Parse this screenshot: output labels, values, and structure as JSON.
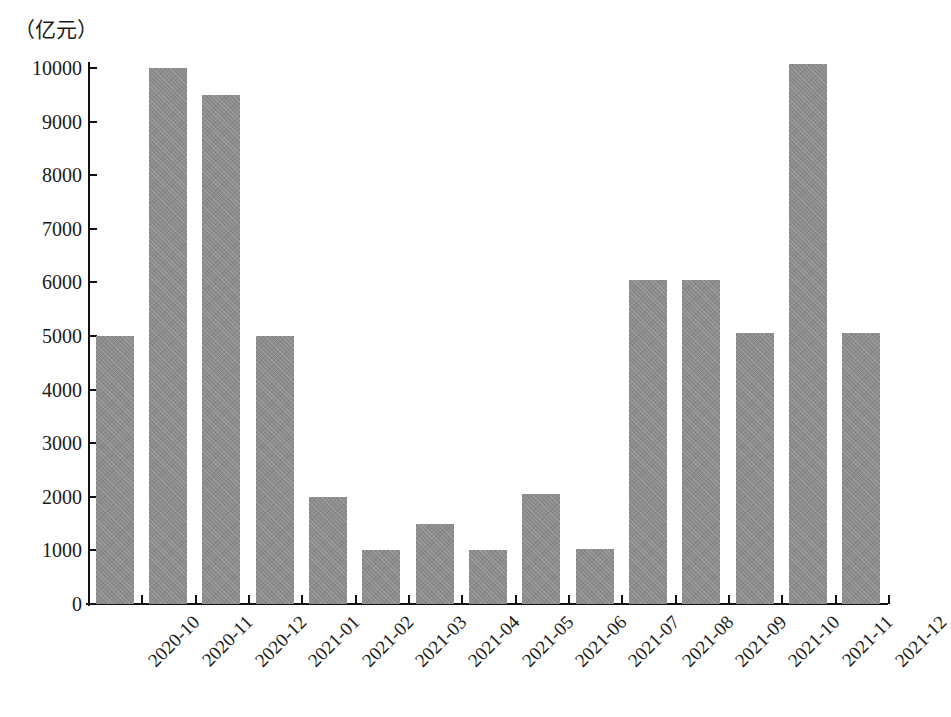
{
  "chart_data": {
    "type": "bar",
    "title": "",
    "subtitle": "",
    "xlabel": "",
    "ylabel": "（亿元）",
    "ylim": [
      0,
      10000
    ],
    "ytick_step": 1000,
    "yticks": [
      0,
      1000,
      2000,
      3000,
      4000,
      5000,
      6000,
      7000,
      8000,
      9000,
      10000
    ],
    "ytick_labels": [
      "0",
      "1000",
      "2000",
      "3000",
      "4000",
      "5000",
      "6000",
      "7000",
      "8000",
      "9000",
      "10000"
    ],
    "grid": false,
    "legend": null,
    "legend_position": "none",
    "bar_color": "#8c8c8c",
    "axis_color": "#111111",
    "categories": [
      "2020-10",
      "2020-11",
      "2020-12",
      "2021-01",
      "2021-02",
      "2021-03",
      "2021-04",
      "2021-05",
      "2021-06",
      "2021-07",
      "2021-08",
      "2021-09",
      "2021-10",
      "2021-11",
      "2021-12"
    ],
    "values": [
      5000,
      10000,
      9500,
      5000,
      2000,
      1000,
      1500,
      1000,
      2050,
      1030,
      6050,
      6050,
      5050,
      10070,
      5060
    ]
  },
  "figure": {
    "unit_label": "（亿元）",
    "caption": ""
  }
}
